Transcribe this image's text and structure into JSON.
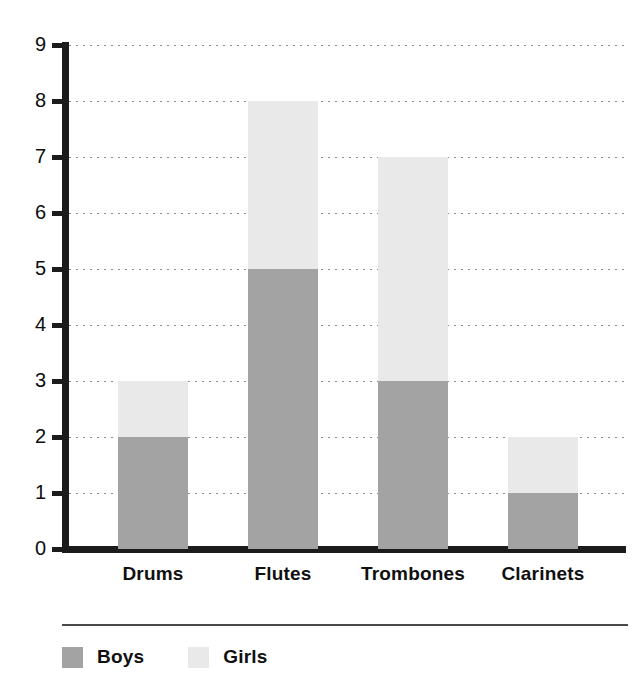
{
  "chart_data": {
    "type": "bar",
    "stacked": true,
    "title": "",
    "subtitle": "",
    "xlabel": "",
    "ylabel": "",
    "categories": [
      "Drums",
      "Flutes",
      "Trombones",
      "Clarinets"
    ],
    "series": [
      {
        "name": "Boys",
        "values": [
          2,
          5,
          3,
          1
        ],
        "color": "#a3a3a3"
      },
      {
        "name": "Girls",
        "values": [
          1,
          3,
          4,
          1
        ],
        "color": "#e9e9e9"
      }
    ],
    "totals": [
      3,
      8,
      7,
      2
    ],
    "ylim": [
      0,
      9
    ],
    "y_ticks": [
      0,
      1,
      2,
      3,
      4,
      5,
      6,
      7,
      8,
      9
    ],
    "y_tick_labels": [
      "0",
      "1",
      "2",
      "3",
      "4",
      "5",
      "6",
      "7",
      "8",
      "9"
    ],
    "grid": true,
    "grid_style": "dotted-horizontal",
    "legend_position": "bottom-left",
    "legend_entries": [
      "Boys",
      "Girls"
    ],
    "axis_color": "#1b1b1b",
    "background_color": "#ffffff"
  },
  "axis": {
    "ticks": [
      {
        "label": "9",
        "value": 9
      },
      {
        "label": "8",
        "value": 8
      },
      {
        "label": "7",
        "value": 7
      },
      {
        "label": "6",
        "value": 6
      },
      {
        "label": "5",
        "value": 5
      },
      {
        "label": "4",
        "value": 4
      },
      {
        "label": "3",
        "value": 3
      },
      {
        "label": "2",
        "value": 2
      },
      {
        "label": "1",
        "value": 1
      },
      {
        "label": "0",
        "value": 0
      }
    ]
  },
  "categories": [
    {
      "label": "Drums",
      "boys": 2,
      "girls": 1
    },
    {
      "label": "Flutes",
      "boys": 5,
      "girls": 3
    },
    {
      "label": "Trombones",
      "boys": 3,
      "girls": 4
    },
    {
      "label": "Clarinets",
      "boys": 1,
      "girls": 1
    }
  ],
  "legend": {
    "items": [
      {
        "label": "Boys",
        "color": "#a3a3a3"
      },
      {
        "label": "Girls",
        "color": "#e9e9e9"
      }
    ]
  }
}
